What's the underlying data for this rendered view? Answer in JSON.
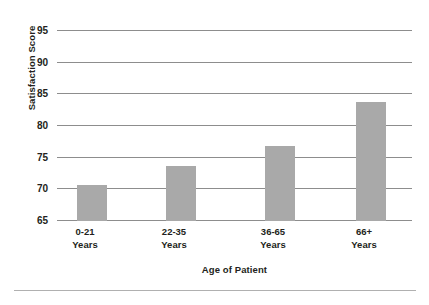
{
  "chart_data": {
    "type": "bar",
    "title": "",
    "subtitle": "",
    "xlabel": "Age of Patient",
    "ylabel": "Satisfaction Score",
    "categories": [
      "0-21 Years",
      "22-35 Years",
      "36-65 Years",
      "66+ Years"
    ],
    "category_lines": [
      {
        "line1": "0-21",
        "line2": "Years"
      },
      {
        "line1": "22-35",
        "line2": "Years"
      },
      {
        "line1": "36-65",
        "line2": "Years"
      },
      {
        "line1": "66+",
        "line2": "Years"
      }
    ],
    "values": [
      70.7,
      73.7,
      76.8,
      83.7
    ],
    "ylim": [
      65,
      95
    ],
    "yticks": [
      65,
      70,
      75,
      80,
      85,
      90,
      95
    ],
    "ytick_labels": [
      "65",
      "70",
      "75",
      "80",
      "85",
      "90",
      "95"
    ],
    "grid": true,
    "grid_axis": "y",
    "legend": false,
    "legend_position": "none",
    "bar_color": "#a9a9a9",
    "grid_color": "#8d8d8d",
    "text_color": "#231f20"
  }
}
